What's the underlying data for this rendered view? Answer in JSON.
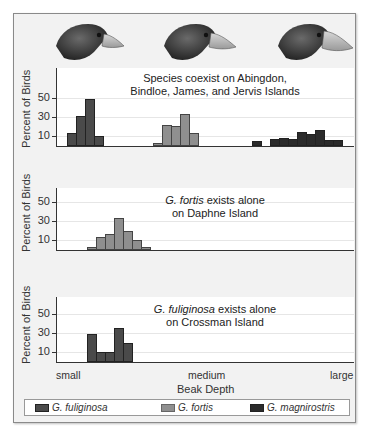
{
  "chart_data": {
    "type": "bar",
    "xlabel": "Beak Depth",
    "ylabel": "Percent of Birds",
    "x_categories": [
      "small",
      "medium",
      "large"
    ],
    "y_ticks": [
      10,
      30,
      50
    ],
    "ylim": [
      0,
      60
    ],
    "legend": [
      {
        "name": "G. fuliginosa",
        "color": "#4a4a4a"
      },
      {
        "name": "G. fortis",
        "color": "#8f8f8f"
      },
      {
        "name": "G. magnirostris",
        "color": "#2b2b2b"
      }
    ],
    "panels": [
      {
        "title_line1": "Species coexist on Abingdon,",
        "title_line2": "Bindloe, James, and Jervis Islands",
        "series": [
          {
            "name": "G. fuliginosa",
            "bin_start": 11,
            "values": [
              13,
              31,
              48,
              10
            ]
          },
          {
            "name": "G. fortis",
            "bin_start": 97,
            "values": [
              3,
              22,
              21,
              33,
              13
            ]
          },
          {
            "name": "G. magnirostris",
            "bin_start": 196,
            "values": [
              5,
              0,
              7,
              8,
              7,
              14,
              12,
              17,
              6,
              6
            ]
          }
        ]
      },
      {
        "title_italic": "G. fortis",
        "title_line1": " exists alone",
        "title_line2": "on Daphne Island",
        "series": [
          {
            "name": "G. fortis",
            "bin_start": 31,
            "values": [
              3,
              13,
              17,
              33,
              20,
              10,
              3
            ]
          }
        ]
      },
      {
        "title_italic": "G. fuliginosa",
        "title_line1": " exists alone",
        "title_line2": "on Crossman Island",
        "series": [
          {
            "name": "G. fuliginosa",
            "bin_start": 31,
            "values": [
              29,
              10,
              10,
              35,
              20
            ]
          }
        ]
      }
    ]
  },
  "axis": {
    "ylabel": "Percent of Birds",
    "ticks": [
      "50",
      "30",
      "10"
    ],
    "xcats": {
      "small": "small",
      "medium": "medium",
      "large": "large"
    },
    "xlabel": "Beak Depth"
  },
  "panels": [
    {
      "title_line1": "Species coexist on Abingdon,",
      "title_line2": "Bindloe, James, and Jervis Islands"
    },
    {
      "title_italic": "G. fortis",
      "title_rest": " exists alone",
      "title_line2": "on Daphne Island"
    },
    {
      "title_italic": "G. fuliginosa",
      "title_rest": " exists alone",
      "title_line2": "on Crossman Island"
    }
  ],
  "legend": {
    "fuliginosa": "G. fuliginosa",
    "fortis": "G. fortis",
    "magnirostris": "G. magnirostris"
  },
  "colors": {
    "fuliginosa": "#4a4a4a",
    "fortis": "#8f8f8f",
    "magnirostris": "#2b2b2b"
  },
  "illustrations": [
    "finch-head-small-beak",
    "finch-head-medium-beak",
    "finch-head-large-beak"
  ]
}
